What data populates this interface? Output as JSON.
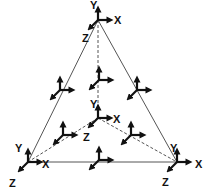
{
  "diagram": {
    "type": "tetrahedron-with-coordinate-frames",
    "colors": {
      "edge": "#555555",
      "axis": "#111111",
      "label": "#111111"
    },
    "vertices": {
      "top": [
        98,
        20
      ],
      "bottom_left": [
        28,
        162
      ],
      "bottom_right": [
        177,
        162
      ],
      "center": [
        98,
        118
      ]
    },
    "solid_edges": [
      [
        "top",
        "bottom_left"
      ],
      [
        "top",
        "bottom_right"
      ],
      [
        "bottom_left",
        "bottom_right"
      ]
    ],
    "dashed_edges": [
      [
        "top",
        "center"
      ],
      [
        "center",
        "bottom_left"
      ],
      [
        "center",
        "bottom_right"
      ]
    ],
    "labels": {
      "top": {
        "y": "Y",
        "x": "X",
        "z": "Z"
      },
      "center": {
        "y": "Y",
        "x": "X",
        "z": "Z"
      },
      "bottom_left": {
        "y": "Y",
        "x": "X",
        "z": "Z"
      },
      "bottom_right": {
        "y": "Y",
        "x": "X",
        "z": "Z"
      }
    },
    "frames": [
      {
        "name": "frame-top-vertex",
        "origin": [
          98,
          20
        ],
        "labeled": true
      },
      {
        "name": "frame-center-vertex",
        "origin": [
          98,
          118
        ],
        "labeled": true
      },
      {
        "name": "frame-bottom-left-vertex",
        "origin": [
          28,
          162
        ],
        "labeled": true
      },
      {
        "name": "frame-bottom-right-vertex",
        "origin": [
          177,
          162
        ],
        "labeled": true
      },
      {
        "name": "frame-left-edge-mid",
        "origin": [
          60,
          90
        ],
        "labeled": false
      },
      {
        "name": "frame-right-edge-mid",
        "origin": [
          137,
          90
        ],
        "labeled": false
      },
      {
        "name": "frame-top-center-edge-mid",
        "origin": [
          99,
          80
        ],
        "labeled": false
      },
      {
        "name": "frame-bottom-edge-mid",
        "origin": [
          99,
          160
        ],
        "labeled": false
      },
      {
        "name": "frame-lower-left-inner",
        "origin": [
          63,
          135
        ],
        "labeled": false
      },
      {
        "name": "frame-lower-right-inner",
        "origin": [
          131,
          135
        ],
        "labeled": false
      }
    ]
  }
}
